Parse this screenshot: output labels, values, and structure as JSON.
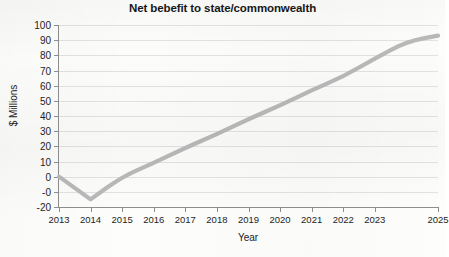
{
  "chart_data": {
    "type": "line",
    "title": "Net bebefit to state/commonwealth",
    "xlabel": "Year",
    "ylabel": "$ Millions",
    "xlim": [
      2013,
      2025
    ],
    "ylim": [
      -20,
      100
    ],
    "ytick_labels": [
      "100",
      "90",
      "80",
      "70",
      "60",
      "50",
      "40",
      "30",
      "20",
      "10",
      "0",
      "-0",
      "-20"
    ],
    "ytick_values": [
      100,
      90,
      80,
      70,
      60,
      50,
      40,
      30,
      20,
      10,
      0,
      -10,
      -20
    ],
    "xtick_labels": [
      "2013",
      "2014",
      "2015",
      "2016",
      "2017",
      "2018",
      "2019",
      "2020",
      "2021",
      "2022",
      "2023",
      "2025"
    ],
    "xtick_values": [
      2013,
      2014,
      2015,
      2016,
      2017,
      2018,
      2019,
      2020,
      2021,
      2022,
      2023,
      2025
    ],
    "grid": true,
    "legend": false,
    "series": [
      {
        "name": "Net benefit",
        "x": [
          2013,
          2014,
          2015,
          2016,
          2017,
          2018,
          2019,
          2020,
          2021,
          2022,
          2023,
          2024,
          2025
        ],
        "values": [
          0,
          -15,
          0,
          9,
          19,
          28,
          38,
          47,
          57,
          66,
          78,
          89,
          93
        ]
      }
    ],
    "line_color": "#b9b9b9",
    "grid_color": "#e2e2e2",
    "axis_color": "#8e8e8e",
    "plot_background": "#fcfcfb"
  }
}
